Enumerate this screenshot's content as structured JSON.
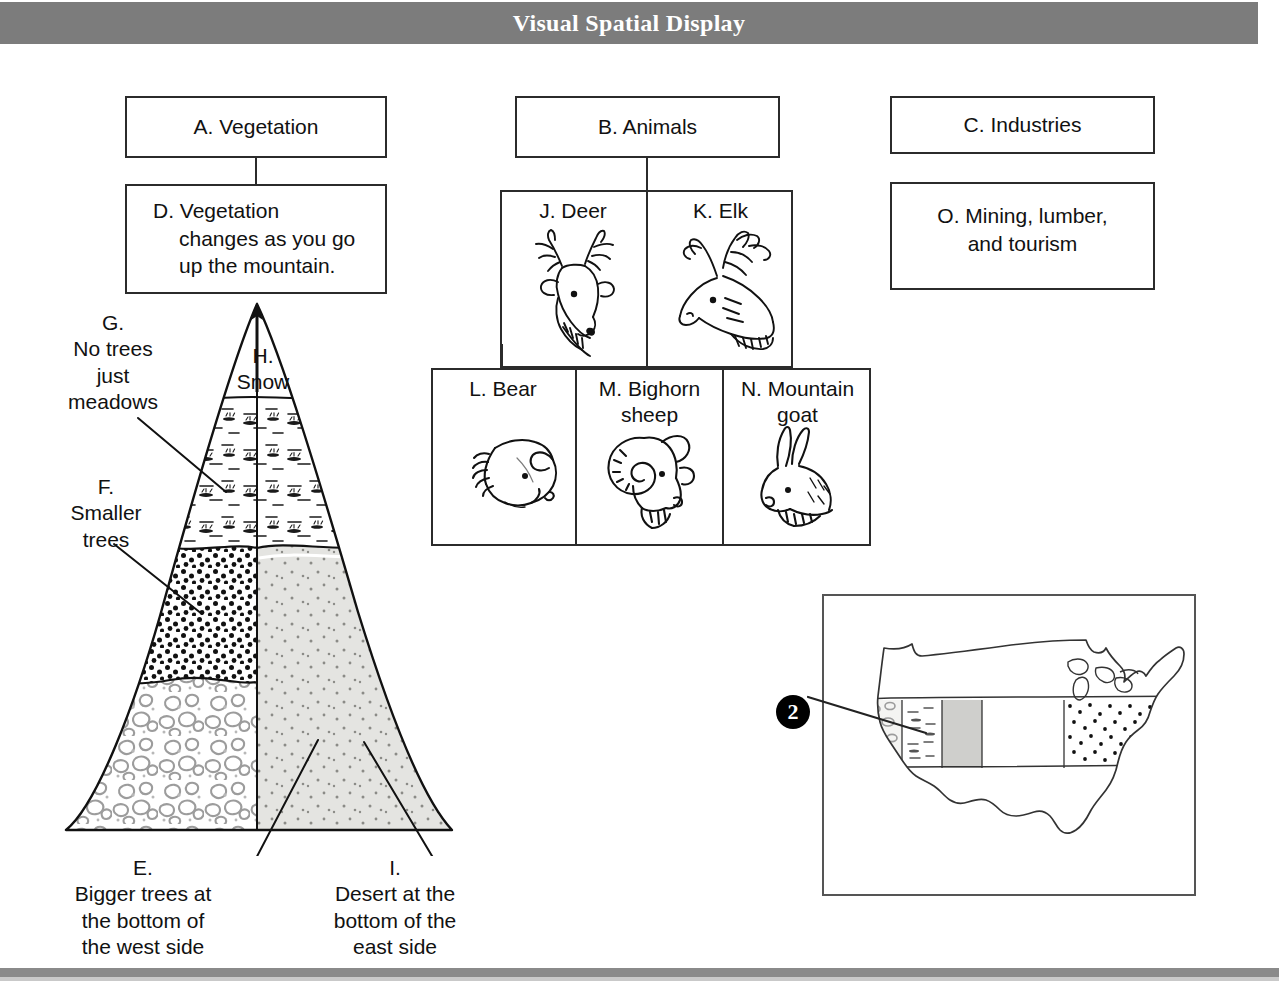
{
  "header": {
    "title": "Visual Spatial Display"
  },
  "columns": {
    "a": {
      "title": "A. Vegetation",
      "detail_line1": "D. Vegetation",
      "detail_line2": "changes as you go",
      "detail_line3": "up the mountain."
    },
    "b": {
      "title": "B. Animals",
      "cells": [
        {
          "label": "J. Deer",
          "icon": "deer-head-icon"
        },
        {
          "label": "K. Elk",
          "icon": "elk-head-icon"
        },
        {
          "label": "L. Bear",
          "icon": "bear-head-icon"
        },
        {
          "label": "M. Bighorn\nsheep",
          "icon": "bighorn-sheep-head-icon"
        },
        {
          "label": "N. Mountain\ngoat",
          "icon": "mountain-goat-head-icon"
        }
      ]
    },
    "c": {
      "title": "C. Industries",
      "detail": "O. Mining, lumber,\nand tourism"
    }
  },
  "mountain": {
    "label_g": "G.\nNo trees\njust\nmeadows",
    "label_f": "F.\nSmaller\ntrees",
    "label_h": "H.\nSnow",
    "label_e": "E.\nBigger trees at\nthe bottom of\nthe west side",
    "label_i": "I.\nDesert at the\nbottom of the\neast side"
  },
  "map": {
    "callout_number": "2"
  },
  "colors": {
    "header_band": "#7c7c7c",
    "header_text": "#ffffff",
    "box_border": "#2b2b2b",
    "page_background": "#ffffff",
    "ink": "#111111",
    "desert_fill": "#e2e2e0",
    "map_border": "#555555"
  }
}
